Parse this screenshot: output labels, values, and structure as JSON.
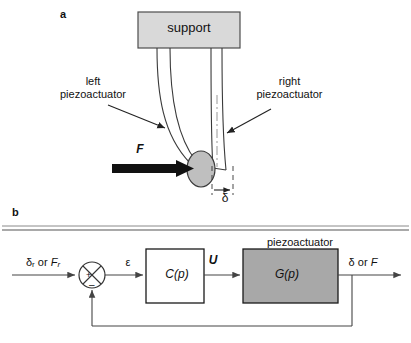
{
  "figure": {
    "panels": [
      {
        "id": "a",
        "label": "a",
        "name": "piezoactuator-schematic",
        "elements": {
          "support_box_text": "support",
          "left_annotation": "left\npiezoactuator",
          "left_annotation_line1": "left",
          "left_annotation_line2": "piezoactuator",
          "right_annotation_line1": "right",
          "right_annotation_line2": "piezoactuator",
          "force_label": "F",
          "deflection_label": "δ"
        },
        "colors": {
          "support_fill": "#d9d9d9",
          "support_stroke": "#4d4d4d",
          "beam_stroke": "#3a3a3a",
          "tip_fill": "#bfbfbf",
          "tip_stroke": "#3a3a3a",
          "force_arrow": "#000000"
        }
      },
      {
        "id": "b",
        "label": "b",
        "name": "feedback-control-block-diagram",
        "elements": {
          "input_label": "δr or Fr",
          "input_label_sym1": "δ",
          "input_label_sub1": "r",
          "input_label_conj": " or ",
          "input_label_sym2": "F",
          "input_label_sub2": "r",
          "error_label": "ε",
          "control_signal_label": "U",
          "output_label": "δ or F",
          "output_sym1": "δ",
          "output_conj": " or ",
          "output_sym2": "F",
          "controller_block_label": "C(p)",
          "plant_block_label": "G(p)",
          "plant_block_caption": "piezoactuator",
          "summing_plus": "+",
          "summing_minus": "–"
        },
        "colors": {
          "controller_fill": "#ffffff",
          "controller_stroke": "#1a1a1a",
          "plant_fill": "#a8a8a8",
          "plant_stroke": "#1a1a1a",
          "signal_line": "#444444",
          "divider": "#555555"
        }
      }
    ]
  }
}
